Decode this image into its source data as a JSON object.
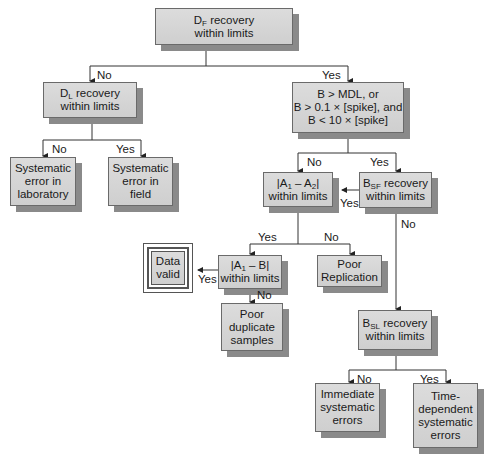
{
  "nodes": {
    "df": {
      "pre": "D",
      "sub": "F",
      "post": " recovery\nwithin limits"
    },
    "dl": {
      "pre": "D",
      "sub": "L",
      "post": " recovery\nwithin limits"
    },
    "bmdl": {
      "text": "B > MDL, or\nB > 0.1 × [spike], and\nB < 10 × [spike]"
    },
    "sys_lab": {
      "text": "Systematic\nerror in\nlaboratory"
    },
    "sys_field": {
      "text": "Systematic\nerror in\nfield"
    },
    "a1a2": {
      "pre": "|A",
      "sub": "1",
      "mid": " – A",
      "sub2": "2",
      "post": "|\nwithin limits"
    },
    "bsf": {
      "pre": "B",
      "sub": "SF",
      "post": " recovery\nwithin limits"
    },
    "data_valid": {
      "text": "Data\nvalid"
    },
    "a1b": {
      "pre": "|A",
      "sub": "1",
      "post": " – B|\nwithin limits"
    },
    "poor_rep": {
      "text": "Poor\nReplication"
    },
    "poor_dup": {
      "text": "Poor\nduplicate\nsamples"
    },
    "bsl": {
      "pre": "B",
      "sub": "SL",
      "post": " recovery\nwithin limits"
    },
    "immediate": {
      "text": "Immediate\nsystematic\nerrors"
    },
    "time_dep": {
      "text": "Time-\ndependent\nsystematic\nerrors"
    }
  },
  "edge_labels": {
    "df_no": "No",
    "df_yes": "Yes",
    "dl_no": "No",
    "dl_yes": "Yes",
    "bmdl_no": "No",
    "bmdl_yes": "Yes",
    "bsf_yes": "Yes",
    "bsf_no": "No",
    "a1a2_yes": "Yes",
    "a1a2_no": "No",
    "a1b_yes": "Yes",
    "a1b_no": "No",
    "bsl_no": "No",
    "bsl_yes": "Yes"
  },
  "colors": {
    "box_fill": "#d5d5d5",
    "box_shadow": "#8a8a8a",
    "line": "#333333",
    "background": "#ffffff"
  }
}
